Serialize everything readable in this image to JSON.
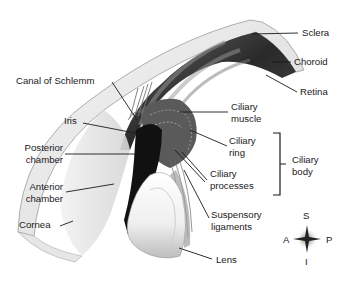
{
  "diagram": {
    "labels": {
      "sclera": "Sclera",
      "choroid": "Choroid",
      "retina": "Retina",
      "canal_of_schlemm": "Canal of Schlemm",
      "iris": "Iris",
      "ciliary_muscle_1": "Ciliary",
      "ciliary_muscle_2": "muscle",
      "posterior_chamber_1": "Posterior",
      "posterior_chamber_2": "chamber",
      "ciliary_ring_1": "Ciliary",
      "ciliary_ring_2": "ring",
      "ciliary_body_1": "Ciliary",
      "ciliary_body_2": "body",
      "anterior_chamber_1": "Anterior",
      "anterior_chamber_2": "chamber",
      "ciliary_processes_1": "Ciliary",
      "ciliary_processes_2": "processes",
      "cornea": "Cornea",
      "suspensory_ligaments_1": "Suspensory",
      "suspensory_ligaments_2": "ligaments",
      "lens": "Lens"
    },
    "compass": {
      "superior": "S",
      "inferior": "I",
      "anterior": "A",
      "posterior": "P"
    },
    "colors": {
      "ink": "#1a1a1a",
      "background": "#ffffff"
    }
  }
}
